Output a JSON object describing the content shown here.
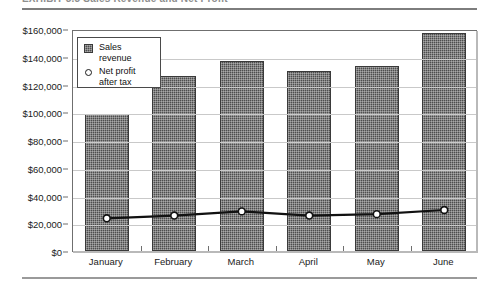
{
  "figure": {
    "caption": "EXHIBIT 5.3   Sales Revenue and Net Profit",
    "caption_visible_fragment": true
  },
  "legend": {
    "position": "inside-top-left",
    "entries": [
      {
        "label_line1": "Sales",
        "label_line2": "revenue",
        "marker": "square-swatch"
      },
      {
        "label_line1": "Net profit",
        "label_line2": "after tax",
        "marker": "open-circle"
      }
    ]
  },
  "chart_data": {
    "type": "bar",
    "title": "",
    "xlabel": "",
    "ylabel": "",
    "grid": true,
    "ylim": [
      0,
      160000
    ],
    "categories": [
      "January",
      "February",
      "March",
      "April",
      "May",
      "June"
    ],
    "yticks": [
      0,
      20000,
      40000,
      60000,
      80000,
      100000,
      120000,
      140000,
      160000
    ],
    "ytick_labels": [
      "$0",
      "$20,000",
      "$40,000",
      "$60,000",
      "$80,000",
      "$100,000",
      "$120,000",
      "$140,000",
      "$160,000"
    ],
    "series": [
      {
        "name": "Sales revenue",
        "type": "bar",
        "color": "#4e4e4e",
        "values": [
          99000,
          126000,
          137000,
          130000,
          133500,
          157000
        ]
      },
      {
        "name": "Net profit after tax",
        "type": "line",
        "color": "#111111",
        "marker": "open-circle",
        "values": [
          25000,
          27000,
          30000,
          27000,
          28000,
          31000
        ]
      }
    ]
  },
  "colors": {
    "bar_fill": "#4e4e4e",
    "line": "#111111",
    "grid": "#c9c9c9",
    "frame": "#6f6f6f",
    "rule": "#7d7d7d"
  }
}
